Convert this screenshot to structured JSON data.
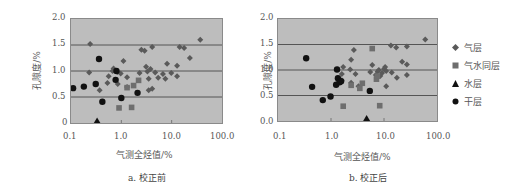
{
  "colors": {
    "plot_bg": "#bdbdbd",
    "gridline": "#555555",
    "gas": "#5a5a5a",
    "gas_water": "#6e6e6e",
    "water": "#111111",
    "dry": "#111111"
  },
  "legend": [
    {
      "name": "气层",
      "marker": "diamond"
    },
    {
      "name": "气水同层",
      "marker": "square"
    },
    {
      "name": "水层",
      "marker": "triangle"
    },
    {
      "name": "干层",
      "marker": "circle"
    }
  ],
  "panels": [
    {
      "ylabel": "孔隙度/%",
      "xlabel": "气测全烃值/%",
      "caption": "a. 校正前",
      "yticks": [
        "2.0",
        "1.5",
        "1.0",
        "0.5",
        "0"
      ],
      "xticks": [
        "0.1",
        "1.0",
        "10.0",
        "100.0"
      ]
    },
    {
      "ylabel": "孔隙度/%",
      "xlabel": "气测全烃值/%",
      "caption": "b. 校正后",
      "yticks": [
        "2.0",
        "1.5",
        "1.0",
        "0.5",
        "0.0"
      ],
      "xticks": [
        "0.1",
        "1.0",
        "10.0",
        "100.0"
      ]
    }
  ],
  "chart_data": [
    {
      "type": "scatter",
      "title": "a. 校正前",
      "xlabel": "气测全烃值/%",
      "ylabel": "孔隙度/%",
      "xscale": "log",
      "xlim": [
        0.1,
        100
      ],
      "ylim": [
        0,
        2.0
      ],
      "grid": "horizontal at 0.5,1.0,1.5",
      "legend_position": "right",
      "series": [
        {
          "name": "气层",
          "marker": "diamond",
          "points": [
            [
              0.24,
              1.52
            ],
            [
              0.23,
              0.97
            ],
            [
              0.37,
              0.63
            ],
            [
              0.53,
              0.77
            ],
            [
              0.56,
              0.9
            ],
            [
              0.67,
              1.0
            ],
            [
              0.7,
              1.05
            ],
            [
              0.84,
              0.98
            ],
            [
              0.85,
              0.75
            ],
            [
              0.97,
              0.95
            ],
            [
              1.1,
              1.19
            ],
            [
              1.3,
              0.88
            ],
            [
              1.3,
              0.69
            ],
            [
              2.3,
              0.96
            ],
            [
              2.5,
              1.41
            ],
            [
              2.9,
              1.39
            ],
            [
              3.1,
              1.08
            ],
            [
              3.3,
              0.99
            ],
            [
              3.5,
              0.85
            ],
            [
              3.5,
              0.63
            ],
            [
              3.8,
              1.04
            ],
            [
              4.1,
              0.66
            ],
            [
              4.1,
              1.46
            ],
            [
              4.7,
              0.97
            ],
            [
              5.4,
              0.87
            ],
            [
              6.7,
              0.94
            ],
            [
              7.5,
              0.85
            ],
            [
              8.1,
              1.14
            ],
            [
              9.8,
              0.96
            ],
            [
              12.8,
              1.1
            ],
            [
              12.8,
              0.9
            ],
            [
              14.4,
              1.46
            ],
            [
              17.7,
              1.44
            ],
            [
              23,
              1.25
            ],
            [
              37,
              1.6
            ]
          ]
        },
        {
          "name": "气水同层",
          "marker": "square",
          "points": [
            [
              0.9,
              0.29
            ],
            [
              1.3,
              0.68
            ],
            [
              1.6,
              0.3
            ],
            [
              1.75,
              0.72
            ],
            [
              2.2,
              0.82
            ]
          ]
        },
        {
          "name": "水层",
          "marker": "triangle",
          "points": [
            [
              0.33,
              0.04
            ]
          ]
        },
        {
          "name": "干层",
          "marker": "circle",
          "points": [
            [
              0.11,
              0.67
            ],
            [
              0.18,
              0.7
            ],
            [
              0.31,
              0.75
            ],
            [
              0.36,
              1.23
            ],
            [
              0.42,
              0.41
            ],
            [
              0.77,
              0.83
            ],
            [
              0.8,
              1.0
            ],
            [
              1.0,
              0.48
            ],
            [
              2.1,
              0.58
            ]
          ]
        }
      ]
    },
    {
      "type": "scatter",
      "title": "b. 校正后",
      "xlabel": "气测全烃值/%",
      "ylabel": "孔隙度/%",
      "xscale": "log",
      "xlim": [
        0.1,
        100
      ],
      "ylim": [
        0,
        2.0
      ],
      "grid": "horizontal at 0.5,1.0,1.5",
      "legend_position": "right",
      "series": [
        {
          "name": "气层",
          "marker": "diamond",
          "points": [
            [
              1.7,
              1.06
            ],
            [
              1.6,
              0.92
            ],
            [
              2.3,
              1.01
            ],
            [
              2.4,
              1.2
            ],
            [
              2.7,
              1.39
            ],
            [
              2.9,
              0.92
            ],
            [
              1.6,
              0.8
            ],
            [
              2.4,
              0.75
            ],
            [
              3.3,
              0.68
            ],
            [
              5.5,
              0.96
            ],
            [
              6.0,
              1.1
            ],
            [
              7.0,
              0.9
            ],
            [
              7.6,
              0.97
            ],
            [
              8.0,
              1.0
            ],
            [
              8.5,
              0.88
            ],
            [
              9.2,
              0.94
            ],
            [
              10.0,
              1.02
            ],
            [
              10.5,
              1.06
            ],
            [
              11.0,
              0.98
            ],
            [
              11.0,
              0.68
            ],
            [
              14.0,
              0.95
            ],
            [
              13.5,
              1.48
            ],
            [
              17.0,
              1.44
            ],
            [
              17.5,
              0.85
            ],
            [
              22.0,
              1.16
            ],
            [
              27,
              1.46
            ],
            [
              27,
              1.11
            ],
            [
              27,
              0.9
            ],
            [
              60,
              1.6
            ]
          ]
        },
        {
          "name": "气水同层",
          "marker": "square",
          "points": [
            [
              1.7,
              0.29
            ],
            [
              2.4,
              0.7
            ],
            [
              3.5,
              0.64
            ],
            [
              3.9,
              0.74
            ],
            [
              6.0,
              1.42
            ],
            [
              7.2,
              0.82
            ],
            [
              7.5,
              0.88
            ],
            [
              8.3,
              0.3
            ]
          ]
        },
        {
          "name": "水层",
          "marker": "triangle",
          "points": [
            [
              4.7,
              0.05
            ]
          ]
        },
        {
          "name": "干层",
          "marker": "circle",
          "points": [
            [
              0.34,
              1.23
            ],
            [
              0.44,
              0.67
            ],
            [
              0.7,
              0.41
            ],
            [
              0.98,
              0.48
            ],
            [
              1.3,
              1.01
            ],
            [
              1.25,
              0.71
            ],
            [
              1.35,
              0.84
            ],
            [
              1.45,
              0.76
            ],
            [
              1.55,
              0.78
            ],
            [
              5.4,
              0.59
            ]
          ]
        }
      ]
    }
  ]
}
